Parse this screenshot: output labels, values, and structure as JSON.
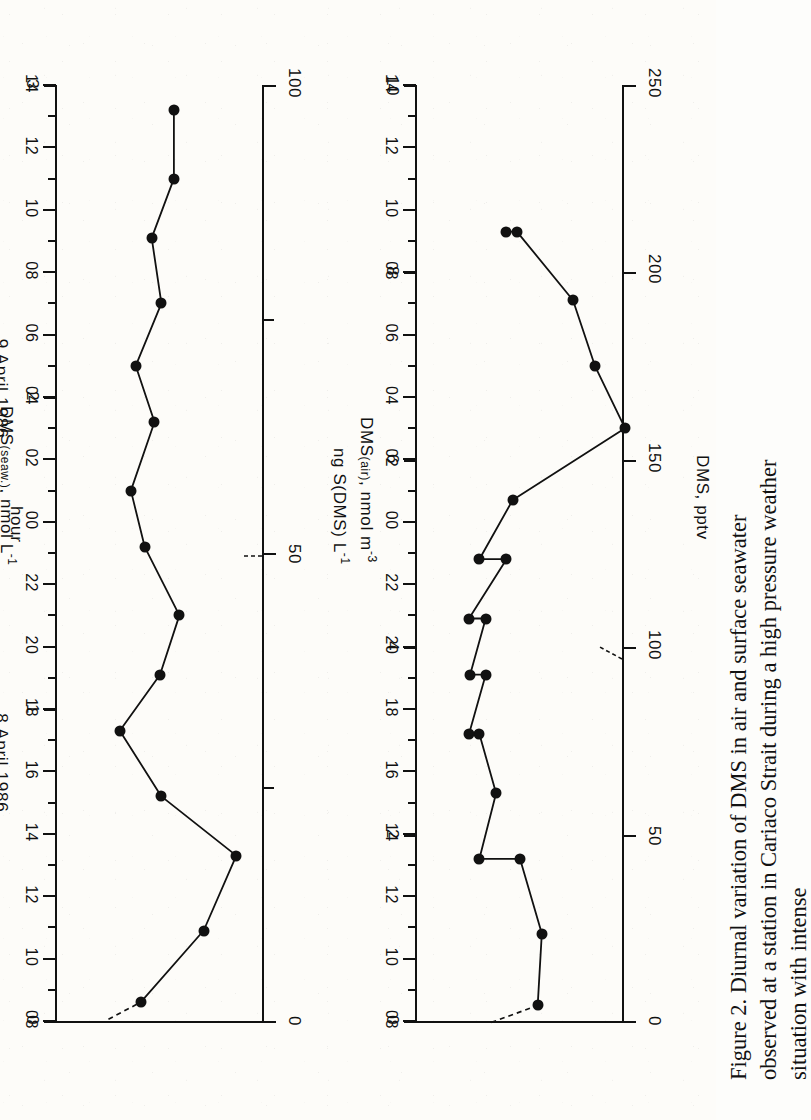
{
  "figure": {
    "label": "Figure 2.",
    "caption": "Diurnal variation of DMS in air and surface seawater observed at a station in Cariaco Strait during a high pressure weather situation with intense"
  },
  "axes": {
    "hour_axis_title": "hour",
    "day_labels": [
      "8  April  1986",
      "9  April  1986"
    ],
    "hour_ticks": [
      "08",
      "10",
      "12",
      "14",
      "16",
      "18",
      "20",
      "22",
      "00",
      "02",
      "04",
      "06",
      "08",
      "10",
      "12",
      "14"
    ]
  },
  "panel_air": {
    "top_axis_title": "DMS, pptv",
    "bottom_axis_title_main": "DMS",
    "bottom_axis_title_sub": "(air)",
    "bottom_axis_title_rest": ", nmol m",
    "bottom_axis_title_sup": "-3",
    "top_ticks": [
      "0",
      "50",
      "100",
      "150",
      "200",
      "250"
    ],
    "bottom_ticks": [
      "0",
      "2",
      "4",
      "6",
      "8",
      "10"
    ]
  },
  "panel_seawater": {
    "top_axis_title_main": "ng S(DMS) L",
    "top_axis_title_sup": "-1",
    "bottom_axis_title_main": "DMS",
    "bottom_axis_title_sub": "(seaw.)",
    "bottom_axis_title_rest": ", nmol L",
    "bottom_axis_title_sup": "-1",
    "top_ticks": [
      "0",
      "50",
      "100"
    ],
    "bottom_ticks": [
      "0",
      "1",
      "2",
      "3"
    ]
  },
  "chart_data": [
    {
      "type": "line",
      "title": "DMS in air",
      "xlabel": "hour",
      "ylabel": "DMS(air), nmol m-3",
      "ylabel_secondary": "DMS, pptv",
      "xlim": [
        8,
        38
      ],
      "ylim": [
        0,
        10
      ],
      "ylim_secondary": [
        0,
        250
      ],
      "grid": false,
      "legend": "none",
      "x": [
        8.5,
        10.8,
        13.2,
        13.2,
        15.3,
        17.2,
        17.2,
        19.1,
        19.1,
        20.9,
        20.9,
        22.8,
        22.8,
        24.7,
        27.0,
        29.0,
        31.1,
        33.3,
        33.3
      ],
      "x_hour_labels": [
        "0830",
        "1050",
        "1315",
        "1315",
        "1520",
        "1710",
        "1710",
        "1905",
        "1905",
        "2055",
        "2055",
        "2250",
        "2250",
        "0040",
        "0300",
        "0500",
        "0705",
        "0920",
        "0920"
      ],
      "values": [
        5.85,
        6.05,
        5.0,
        3.05,
        3.85,
        3.05,
        2.55,
        3.35,
        2.6,
        3.35,
        2.55,
        4.35,
        3.05,
        4.65,
        10.05,
        8.6,
        7.55,
        4.85,
        4.35
      ],
      "values_pptv": [
        146,
        151,
        125,
        76,
        96,
        76,
        64,
        84,
        65,
        84,
        64,
        109,
        76,
        116,
        251,
        215,
        189,
        121,
        109
      ]
    },
    {
      "type": "line",
      "title": "DMS in surface seawater",
      "xlabel": "hour",
      "ylabel": "DMS(seaw.), nmol L-1",
      "ylabel_secondary": "ng S(DMS) L-1",
      "xlim": [
        8,
        38
      ],
      "ylim": [
        0,
        3
      ],
      "ylim_secondary": [
        0,
        100
      ],
      "grid": false,
      "legend": "none",
      "x": [
        8.6,
        10.9,
        13.3,
        15.2,
        17.3,
        19.1,
        21.0,
        23.2,
        25.0,
        27.2,
        29.0,
        31.0,
        33.1,
        35.0,
        37.2
      ],
      "x_hour_labels": [
        "0835",
        "1055",
        "1320",
        "1510",
        "1720",
        "1905",
        "2100",
        "2310",
        "0100",
        "0310",
        "0500",
        "0700",
        "0905",
        "1100",
        "1310"
      ],
      "values": [
        1.22,
        2.13,
        2.6,
        1.52,
        0.92,
        1.5,
        1.78,
        1.28,
        1.08,
        1.42,
        1.15,
        1.52,
        1.38,
        1.7,
        1.7
      ],
      "values_ngSL": [
        38,
        66,
        81,
        47,
        29,
        47,
        55,
        40,
        34,
        44,
        36,
        47,
        43,
        53,
        53
      ]
    }
  ]
}
